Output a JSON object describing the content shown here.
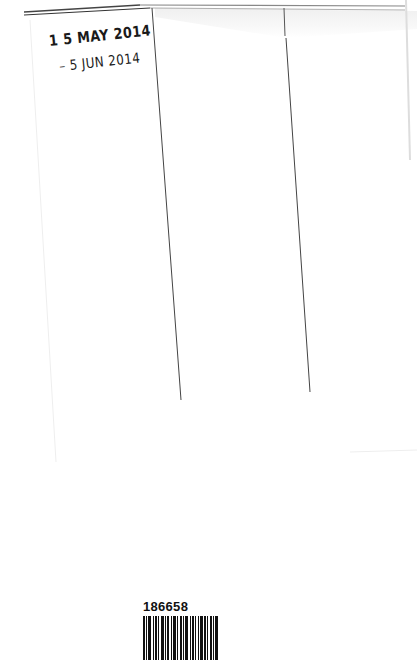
{
  "document": {
    "type": "library date-due slip",
    "columns": 3,
    "stamps": [
      {
        "text": "1 5 MAY  2014"
      },
      {
        "text": "– 5 JUN  2014"
      }
    ],
    "barcode": {
      "number": "186658"
    },
    "colors": {
      "paper": "#ffffff",
      "ink": "#1a1a1a",
      "rule": "#555555"
    }
  }
}
